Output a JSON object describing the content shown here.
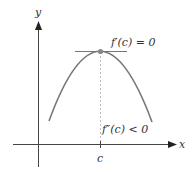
{
  "diagram": {
    "type": "function-graph",
    "axes": {
      "x_label": "x",
      "y_label": "y"
    },
    "tick": {
      "label": "c"
    },
    "annotations": {
      "first_derivative": "f′(c) = 0",
      "second_derivative": "f″(c) < 0"
    },
    "colors": {
      "curve": "#777777",
      "axis": "#333333",
      "point": "#888888",
      "dashed_line": "#aaaaaa"
    }
  }
}
